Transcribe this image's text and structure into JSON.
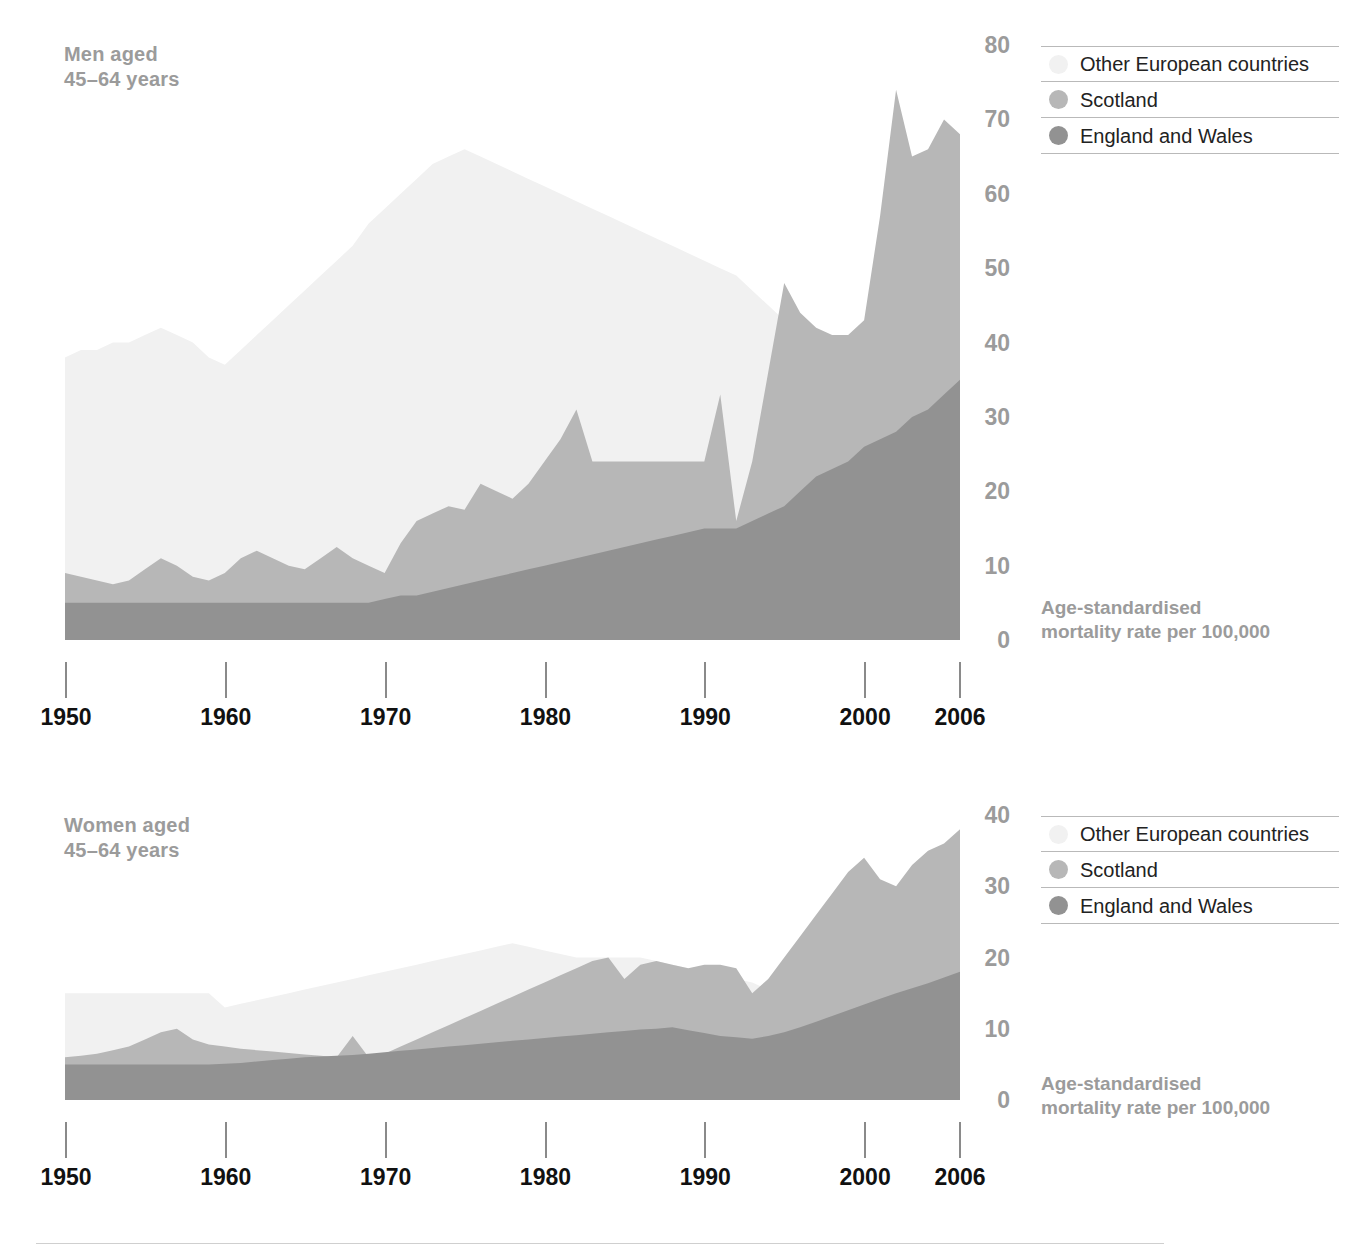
{
  "colors": {
    "other_european": "#f1f1f1",
    "scotland": "#b7b7b7",
    "england_and_wales": "#929292",
    "title_grey": "#9b9b9b",
    "tick_black": "#111111",
    "rule_grey": "#b9b9b9"
  },
  "legend": {
    "items": [
      {
        "label": "Other European countries",
        "swatch_key": "other_european"
      },
      {
        "label": "Scotland",
        "swatch_key": "scotland"
      },
      {
        "label": "England and Wales",
        "swatch_key": "england_and_wales"
      }
    ]
  },
  "axis_caption": "Age-standardised\nmortality rate per 100,000",
  "panels": {
    "men": {
      "title": "Men aged\n45–64 years"
    },
    "women": {
      "title": "Women aged\n45–64 years"
    }
  },
  "chart_data": [
    {
      "type": "area",
      "id": "men-45-64",
      "title": "Men aged 45–64 years",
      "xlabel": "",
      "ylabel": "Age-standardised mortality rate per 100,000",
      "xlim": [
        1950,
        2006
      ],
      "ylim": [
        0,
        80
      ],
      "yticks": [
        0,
        10,
        20,
        30,
        40,
        50,
        60,
        70,
        80
      ],
      "xticks": [
        1950,
        1960,
        1970,
        1980,
        1990,
        2000,
        2006
      ],
      "grid": false,
      "stacked": false,
      "legend_position": "top-right",
      "x": [
        1950,
        1951,
        1952,
        1953,
        1954,
        1955,
        1956,
        1957,
        1958,
        1959,
        1960,
        1961,
        1962,
        1963,
        1964,
        1965,
        1966,
        1967,
        1968,
        1969,
        1970,
        1971,
        1972,
        1973,
        1974,
        1975,
        1976,
        1977,
        1978,
        1979,
        1980,
        1981,
        1982,
        1983,
        1984,
        1985,
        1986,
        1987,
        1988,
        1989,
        1990,
        1991,
        1992,
        1993,
        1994,
        1995,
        1996,
        1997,
        1998,
        1999,
        2000,
        2001,
        2002,
        2003,
        2004,
        2005,
        2006
      ],
      "series": [
        {
          "name": "Other European countries",
          "color": "#f1f1f1",
          "values": [
            38,
            39,
            39,
            40,
            40,
            41,
            42,
            41,
            40,
            38,
            37,
            39,
            41,
            43,
            45,
            47,
            49,
            51,
            53,
            56,
            58,
            60,
            62,
            64,
            65,
            66,
            65,
            64,
            63,
            62,
            61,
            60,
            59,
            58,
            57,
            56,
            55,
            54,
            53,
            52,
            51,
            50,
            49,
            47,
            45,
            43,
            41,
            40,
            39,
            38,
            38,
            38,
            38,
            37,
            36,
            35,
            35
          ]
        },
        {
          "name": "Scotland",
          "color": "#b7b7b7",
          "values": [
            9,
            8.5,
            8,
            7.5,
            8,
            9.5,
            11,
            10,
            8.5,
            8,
            9,
            11,
            12,
            11,
            10,
            9.5,
            11,
            12.5,
            11,
            10,
            9,
            13,
            16,
            17,
            18,
            17.5,
            21,
            20,
            19,
            21,
            24,
            27,
            31,
            24,
            24,
            24,
            24,
            24,
            24,
            24,
            24,
            33,
            16,
            24,
            36,
            48,
            44,
            42,
            41,
            41,
            43,
            57,
            74,
            65,
            66,
            70,
            68
          ]
        },
        {
          "name": "England and Wales",
          "color": "#929292",
          "values": [
            5,
            5,
            5,
            5,
            5,
            5,
            5,
            5,
            5,
            5,
            5,
            5,
            5,
            5,
            5,
            5,
            5,
            5,
            5,
            5,
            5.5,
            6,
            6,
            6.5,
            7,
            7.5,
            8,
            8.5,
            9,
            9.5,
            10,
            10.5,
            11,
            11.5,
            12,
            12.5,
            13,
            13.5,
            14,
            14.5,
            15,
            15,
            15,
            16,
            17,
            18,
            20,
            22,
            23,
            24,
            26,
            27,
            28,
            30,
            31,
            33,
            35
          ]
        }
      ]
    },
    {
      "type": "area",
      "id": "women-45-64",
      "title": "Women aged 45–64 years",
      "xlabel": "",
      "ylabel": "Age-standardised mortality rate per 100,000",
      "xlim": [
        1950,
        2006
      ],
      "ylim": [
        0,
        40
      ],
      "yticks": [
        0,
        10,
        20,
        30,
        40
      ],
      "xticks": [
        1950,
        1960,
        1970,
        1980,
        1990,
        2000,
        2006
      ],
      "grid": false,
      "stacked": false,
      "legend_position": "top-right",
      "x": [
        1950,
        1951,
        1952,
        1953,
        1954,
        1955,
        1956,
        1957,
        1958,
        1959,
        1960,
        1961,
        1962,
        1963,
        1964,
        1965,
        1966,
        1967,
        1968,
        1969,
        1970,
        1971,
        1972,
        1973,
        1974,
        1975,
        1976,
        1977,
        1978,
        1979,
        1980,
        1981,
        1982,
        1983,
        1984,
        1985,
        1986,
        1987,
        1988,
        1989,
        1990,
        1991,
        1992,
        1993,
        1994,
        1995,
        1996,
        1997,
        1998,
        1999,
        2000,
        2001,
        2002,
        2003,
        2004,
        2005,
        2006
      ],
      "series": [
        {
          "name": "Other European countries",
          "color": "#f1f1f1",
          "values": [
            15,
            15,
            15,
            15,
            15,
            15,
            15,
            15,
            15,
            15,
            13,
            13.5,
            14,
            14.5,
            15,
            15.5,
            16,
            16.5,
            17,
            17.5,
            18,
            18.5,
            19,
            19.5,
            20,
            20.5,
            21,
            21.5,
            22,
            21.5,
            21,
            20.5,
            20,
            20,
            20,
            20,
            20,
            19.5,
            19,
            18.5,
            18,
            17.5,
            17,
            16.5,
            15.5,
            14.5,
            13.5,
            12.5,
            11.5,
            10.5,
            9.5,
            8.5,
            7.5,
            6.5,
            5.5,
            4.5,
            3.5
          ]
        },
        {
          "name": "Scotland",
          "color": "#b7b7b7",
          "values": [
            6,
            6.2,
            6.5,
            7,
            7.5,
            8.5,
            9.5,
            10,
            8.5,
            7.8,
            7.5,
            7.2,
            7,
            6.8,
            6.6,
            6.4,
            6.2,
            6,
            9,
            6,
            6.5,
            7.5,
            8.5,
            9.5,
            10.5,
            11.5,
            12.5,
            13.5,
            14.5,
            15.5,
            16.5,
            17.5,
            18.5,
            19.5,
            20,
            17,
            19,
            19.5,
            19,
            18.5,
            19,
            19,
            18.5,
            15,
            17,
            20,
            23,
            26,
            29,
            32,
            34,
            31,
            30,
            33,
            35,
            36,
            38
          ]
        },
        {
          "name": "England and Wales",
          "color": "#929292",
          "values": [
            5,
            5,
            5,
            5,
            5,
            5,
            5,
            5,
            5,
            5,
            5.1,
            5.2,
            5.4,
            5.6,
            5.8,
            6,
            6.1,
            6.2,
            6.3,
            6.5,
            6.7,
            6.9,
            7.1,
            7.3,
            7.5,
            7.7,
            7.9,
            8.1,
            8.3,
            8.5,
            8.7,
            8.9,
            9.1,
            9.3,
            9.5,
            9.7,
            9.9,
            10,
            10.2,
            9.8,
            9.4,
            9,
            8.8,
            8.6,
            9,
            9.5,
            10.2,
            11,
            11.8,
            12.6,
            13.4,
            14.2,
            15,
            15.7,
            16.4,
            17.2,
            18
          ]
        }
      ]
    }
  ]
}
